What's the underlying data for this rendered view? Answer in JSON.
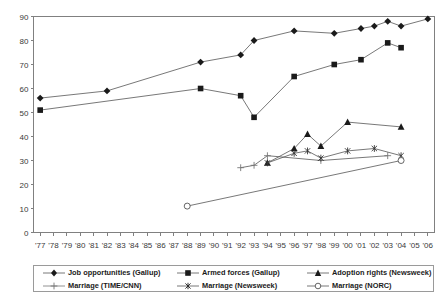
{
  "chart_data": {
    "type": "line",
    "title": "",
    "xlabel": "",
    "ylabel": "",
    "ylim": [
      0,
      90
    ],
    "ytick_step": 10,
    "grid": false,
    "legend_position": "bottom",
    "x_tick_labels": [
      "'77",
      "'78",
      "'79",
      "'80",
      "'81",
      "'82",
      "'83",
      "'84",
      "'85",
      "'86",
      "'87",
      "'88",
      "'89",
      "'90",
      "'91",
      "'92",
      "'93",
      "'94",
      "'95",
      "'96",
      "'97",
      "'98",
      "'99",
      "'00",
      "'01",
      "'02",
      "'03",
      "'04",
      "'05",
      "'06"
    ],
    "y_tick_labels": [
      "0",
      "10",
      "20",
      "30",
      "40",
      "50",
      "60",
      "70",
      "80",
      "90"
    ],
    "series": [
      {
        "name": "Job opportunities (Gallup)",
        "marker": "diamond-filled",
        "points": [
          {
            "x": "'77",
            "y": 56
          },
          {
            "x": "'82",
            "y": 59
          },
          {
            "x": "'89",
            "y": 71
          },
          {
            "x": "'92",
            "y": 74
          },
          {
            "x": "'93",
            "y": 80
          },
          {
            "x": "'96",
            "y": 84
          },
          {
            "x": "'99",
            "y": 83
          },
          {
            "x": "'01",
            "y": 85
          },
          {
            "x": "'02",
            "y": 86
          },
          {
            "x": "'03",
            "y": 88
          },
          {
            "x": "'04",
            "y": 86
          },
          {
            "x": "'06",
            "y": 89
          }
        ]
      },
      {
        "name": "Armed forces (Gallup)",
        "marker": "square-filled",
        "points": [
          {
            "x": "'77",
            "y": 51
          },
          {
            "x": "'89",
            "y": 60
          },
          {
            "x": "'92",
            "y": 57
          },
          {
            "x": "'93",
            "y": 48
          },
          {
            "x": "'96",
            "y": 65
          },
          {
            "x": "'99",
            "y": 70
          },
          {
            "x": "'01",
            "y": 72
          },
          {
            "x": "'03",
            "y": 79
          },
          {
            "x": "'04",
            "y": 77
          }
        ]
      },
      {
        "name": "Adoption rights (Newsweek)",
        "marker": "triangle-filled",
        "points": [
          {
            "x": "'94",
            "y": 29
          },
          {
            "x": "'96",
            "y": 35
          },
          {
            "x": "'97",
            "y": 41
          },
          {
            "x": "'98",
            "y": 36
          },
          {
            "x": "'00",
            "y": 46
          },
          {
            "x": "'04",
            "y": 44
          }
        ]
      },
      {
        "name": "Marriage (TIME/CNN)",
        "marker": "plus",
        "points": [
          {
            "x": "'92",
            "y": 27
          },
          {
            "x": "'93",
            "y": 28
          },
          {
            "x": "'94",
            "y": 32
          },
          {
            "x": "'98",
            "y": 30
          },
          {
            "x": "'03",
            "y": 32
          }
        ]
      },
      {
        "name": "Marriage (Newsweek)",
        "marker": "asterisk",
        "points": [
          {
            "x": "'94",
            "y": 29
          },
          {
            "x": "'96",
            "y": 33
          },
          {
            "x": "'97",
            "y": 34
          },
          {
            "x": "'98",
            "y": 31
          },
          {
            "x": "'00",
            "y": 34
          },
          {
            "x": "'02",
            "y": 35
          },
          {
            "x": "'04",
            "y": 32
          }
        ]
      },
      {
        "name": "Marriage (NORC)",
        "marker": "circle-open",
        "points": [
          {
            "x": "'88",
            "y": 11
          },
          {
            "x": "'04",
            "y": 30
          }
        ]
      }
    ]
  },
  "legend": {
    "entries": [
      {
        "label": "Job opportunities (Gallup)",
        "marker": "diamond-filled"
      },
      {
        "label": "Armed forces (Gallup)",
        "marker": "square-filled"
      },
      {
        "label": "Adoption rights (Newsweek)",
        "marker": "triangle-filled"
      },
      {
        "label": "Marriage (TIME/CNN)",
        "marker": "plus"
      },
      {
        "label": "Marriage (Newsweek)",
        "marker": "asterisk"
      },
      {
        "label": "Marriage (NORC)",
        "marker": "circle-open"
      }
    ]
  },
  "colors": {
    "line": "#555555",
    "marker": "#1a1a1a",
    "axis": "#808080",
    "text": "#1a1a1a",
    "background": "#ffffff"
  }
}
